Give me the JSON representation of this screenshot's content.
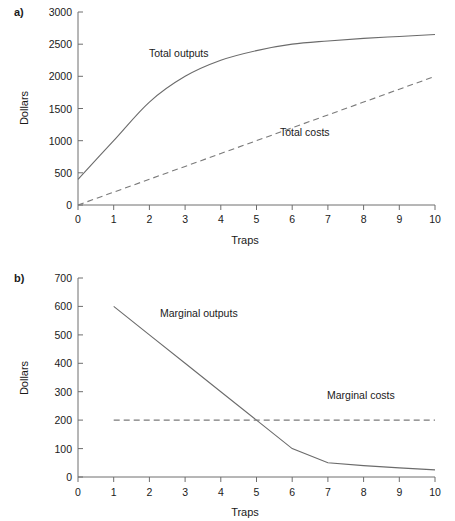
{
  "figure": {
    "background": "#ffffff",
    "line_color": "#6b6b6b",
    "text_color": "#1a1a1a"
  },
  "panel_a": {
    "letter": "a)",
    "ylabel": "Dollars",
    "xlabel": "Traps",
    "ytick_labels": [
      "3000",
      "2500",
      "2000",
      "1500",
      "1000",
      "500",
      "0"
    ],
    "xtick_labels": [
      "0",
      "1",
      "2",
      "3",
      "4",
      "5",
      "6",
      "7",
      "8",
      "9",
      "10"
    ],
    "label_total_outputs": "Total outputs",
    "label_total_costs": "Total costs"
  },
  "panel_b": {
    "letter": "b)",
    "ylabel": "Dollars",
    "xlabel": "Traps",
    "ytick_labels": [
      "700",
      "600",
      "500",
      "400",
      "300",
      "200",
      "100",
      "0"
    ],
    "xtick_labels": [
      "0",
      "1",
      "2",
      "3",
      "4",
      "5",
      "6",
      "7",
      "8",
      "9",
      "10"
    ],
    "label_marginal_outputs": "Marginal outputs",
    "label_marginal_costs": "Marginal costs"
  },
  "chart_data": [
    {
      "type": "line",
      "panel": "a)",
      "title": "",
      "xlabel": "Traps",
      "ylabel": "Dollars",
      "xlim": [
        0,
        10
      ],
      "ylim": [
        0,
        3000
      ],
      "ytick_values": [
        0,
        500,
        1000,
        1500,
        2000,
        2500,
        3000
      ],
      "xtick_values": [
        0,
        1,
        2,
        3,
        4,
        5,
        6,
        7,
        8,
        9,
        10
      ],
      "grid": false,
      "legend": "inline-annotations",
      "x": [
        0,
        1,
        2,
        3,
        4,
        5,
        6,
        7,
        8,
        9,
        10
      ],
      "series": [
        {
          "name": "Total outputs",
          "style": "solid",
          "values": [
            400,
            1000,
            1600,
            2000,
            2250,
            2400,
            2500,
            2550,
            2590,
            2620,
            2650
          ]
        },
        {
          "name": "Total costs",
          "style": "dashed",
          "values": [
            0,
            200,
            400,
            600,
            800,
            1000,
            1200,
            1400,
            1600,
            1800,
            2000
          ]
        }
      ]
    },
    {
      "type": "line",
      "panel": "b)",
      "title": "",
      "xlabel": "Traps",
      "ylabel": "Dollars",
      "xlim": [
        0,
        10
      ],
      "ylim": [
        0,
        700
      ],
      "ytick_values": [
        0,
        100,
        200,
        300,
        400,
        500,
        600,
        700
      ],
      "xtick_values": [
        0,
        1,
        2,
        3,
        4,
        5,
        6,
        7,
        8,
        9,
        10
      ],
      "grid": false,
      "legend": "inline-annotations",
      "x": [
        1,
        2,
        3,
        4,
        5,
        6,
        7,
        8,
        9,
        10
      ],
      "series": [
        {
          "name": "Marginal outputs",
          "style": "solid",
          "values": [
            600,
            500,
            400,
            300,
            200,
            100,
            50,
            40,
            32,
            25
          ]
        },
        {
          "name": "Marginal costs",
          "style": "dashed",
          "values": [
            200,
            200,
            200,
            200,
            200,
            200,
            200,
            200,
            200,
            200
          ]
        }
      ]
    }
  ]
}
